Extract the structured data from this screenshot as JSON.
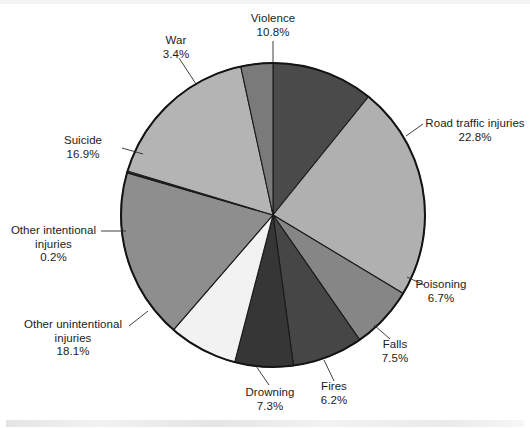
{
  "chart_data": {
    "type": "pie",
    "title": "",
    "subtitle": "",
    "xlabel": "",
    "ylabel": "",
    "legend_position": "none",
    "labels_outside": true,
    "unit": "%",
    "total": 99.9,
    "start_angle_deg": 0,
    "direction": "clockwise",
    "categories": [
      "Violence",
      "Road traffic injuries",
      "Poisoning",
      "Falls",
      "Fires",
      "Drowning",
      "Other unintentional injuries",
      "Other intentional injuries",
      "Suicide",
      "War"
    ],
    "values": [
      10.8,
      22.8,
      6.7,
      7.5,
      6.2,
      7.3,
      18.1,
      0.2,
      16.9,
      3.4
    ],
    "value_labels": [
      "10.8%",
      "22.8%",
      "6.7%",
      "7.5%",
      "6.2%",
      "7.3%",
      "18.1%",
      "0.2%",
      "16.9%",
      "3.4%"
    ],
    "colors": [
      "#4a4a4a",
      "#b0b0b0",
      "#868686",
      "#464646",
      "#363636",
      "#f2f2f2",
      "#8e8e8e",
      "#2b2b2b",
      "#b4b4b4",
      "#7a7a7a"
    ],
    "slice_outline_color": "#1a1a1a",
    "background_color": "#ffffff",
    "text_color": "#1c1c1c",
    "slices": [
      {
        "name": "Violence",
        "value": 10.8,
        "value_label": "10.8%",
        "color": "#4a4a4a"
      },
      {
        "name": "Road traffic injuries",
        "value": 22.8,
        "value_label": "22.8%",
        "color": "#b0b0b0"
      },
      {
        "name": "Poisoning",
        "value": 6.7,
        "value_label": "6.7%",
        "color": "#868686"
      },
      {
        "name": "Falls",
        "value": 7.5,
        "value_label": "7.5%",
        "color": "#464646"
      },
      {
        "name": "Fires",
        "value": 6.2,
        "value_label": "6.2%",
        "color": "#363636"
      },
      {
        "name": "Drowning",
        "value": 7.3,
        "value_label": "7.3%",
        "color": "#f2f2f2"
      },
      {
        "name": "Other unintentional injuries",
        "value": 18.1,
        "value_label": "18.1%",
        "color": "#8e8e8e"
      },
      {
        "name": "Other intentional injuries",
        "value": 0.2,
        "value_label": "0.2%",
        "color": "#2b2b2b"
      },
      {
        "name": "Suicide",
        "value": 16.9,
        "value_label": "16.9%",
        "color": "#b4b4b4"
      },
      {
        "name": "War",
        "value": 3.4,
        "value_label": "3.4%",
        "color": "#7a7a7a"
      }
    ]
  },
  "labels": {
    "violence": {
      "name": "Violence",
      "pct": "10.8%"
    },
    "war": {
      "name": "War",
      "pct": "3.4%"
    },
    "suicide": {
      "name": "Suicide",
      "pct": "16.9%"
    },
    "other_int": {
      "line1": "Other intentional",
      "line2": "injuries",
      "pct": "0.2%"
    },
    "other_unint": {
      "line1": "Other unintentional",
      "line2": "injuries",
      "pct": "18.1%"
    },
    "drowning": {
      "name": "Drowning",
      "pct": "7.3%"
    },
    "fires": {
      "name": "Fires",
      "pct": "6.2%"
    },
    "falls": {
      "name": "Falls",
      "pct": "7.5%"
    },
    "poisoning": {
      "name": "Poisoning",
      "pct": "6.7%"
    },
    "road": {
      "name": "Road traffic injuries",
      "pct": "22.8%"
    }
  }
}
